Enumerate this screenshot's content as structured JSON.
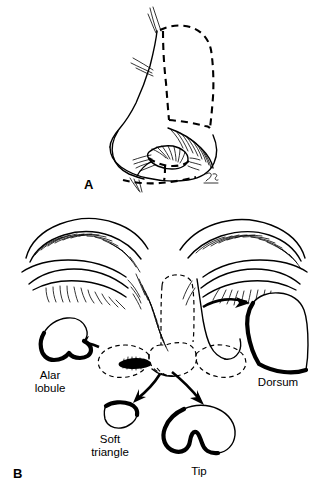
{
  "figure": {
    "background_color": "#ffffff",
    "ink_color": "#000000"
  },
  "panels": [
    {
      "id": "A",
      "label": "A",
      "view": "lateral-oblique nose",
      "description": "Lateral view of the nose with dashed lines outlining the dorsum subunit and the alar lobule / nostril sill boundaries."
    },
    {
      "id": "B",
      "label": "B",
      "view": "frontal face",
      "description": "Frontal view of the midface with closed eyes and eyebrows; dashed lines outline the nasal subunits, and arrows lead to the four extracted subunit templates."
    }
  ],
  "subunits": [
    {
      "key": "dorsum",
      "label": "Dorsum",
      "label_lines": [
        "Dorsum"
      ],
      "arrow_direction": "right",
      "position": "right"
    },
    {
      "key": "alar_lobule",
      "label": "Alar lobule",
      "label_lines": [
        "Alar",
        "lobule"
      ],
      "arrow_direction": "left",
      "position": "left"
    },
    {
      "key": "soft_triangle",
      "label": "Soft triangle",
      "label_lines": [
        "Soft",
        "triangle"
      ],
      "arrow_direction": "down-left",
      "position": "lower-left"
    },
    {
      "key": "tip",
      "label": "Tip",
      "label_lines": [
        "Tip"
      ],
      "arrow_direction": "down-right",
      "position": "lower-center"
    }
  ],
  "signature": {
    "present": true,
    "text": "JS"
  }
}
